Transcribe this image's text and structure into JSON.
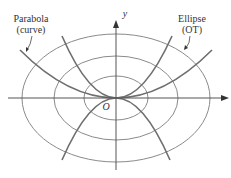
{
  "diagram": {
    "labels": {
      "parabola_title": "Parabola",
      "parabola_sub": "(curve)",
      "ellipse_title": "Ellipse",
      "ellipse_sub": "(OT)",
      "y_axis": "y",
      "origin": "O"
    },
    "colors": {
      "curve": "#7a7a7a",
      "axis": "#555555",
      "text": "#333333"
    },
    "origin": {
      "x": 116,
      "y": 98
    },
    "ellipses": [
      {
        "rx": 32,
        "ry": 22
      },
      {
        "rx": 62,
        "ry": 42
      },
      {
        "rx": 94,
        "ry": 64
      }
    ],
    "parabolas": [
      {
        "direction": "up",
        "label": "curve"
      },
      {
        "direction": "down",
        "label": "curve"
      }
    ]
  }
}
